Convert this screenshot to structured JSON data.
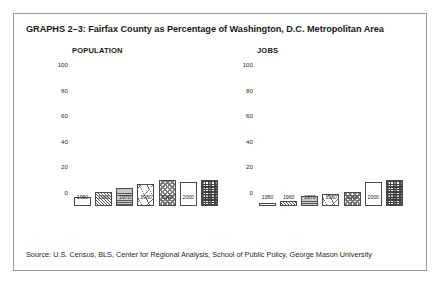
{
  "figure": {
    "title": "GRAPHS 2–3: Fairfax County as Percentage of Washington, D.C. Metropolitan Area",
    "source": "Source: U.S. Census, BLS, Center for Regional Analysis, School of Public Policy, George Mason University",
    "frame_color": "#9a9a9a",
    "text_color": "#1a1a1a"
  },
  "chart_data": [
    {
      "type": "bar",
      "title": "POPULATION",
      "categories": [
        "1950",
        "1960",
        "1970",
        "1980",
        "1990",
        "2000",
        "2007"
      ],
      "values": [
        7,
        11,
        14,
        17,
        20,
        19,
        20
      ],
      "xlabel": "",
      "ylabel": "",
      "ylim": [
        0,
        100
      ],
      "yticks": [
        0,
        20,
        40,
        60,
        80,
        100
      ],
      "grid": false,
      "legend": "none",
      "bar_patterns": [
        "dots",
        "diagonal",
        "horizontal",
        "scribble",
        "checker",
        "sparse-dots",
        "plaid"
      ]
    },
    {
      "type": "bar",
      "title": "JOBS",
      "categories": [
        "1950",
        "1960",
        "1970",
        "1980",
        "1990",
        "2000",
        "2007"
      ],
      "values": [
        2,
        4,
        8,
        9,
        11,
        19,
        20
      ],
      "xlabel": "",
      "ylabel": "",
      "ylim": [
        0,
        100
      ],
      "yticks": [
        0,
        20,
        40,
        60,
        80,
        100
      ],
      "grid": false,
      "legend": "none",
      "bar_patterns": [
        "dots",
        "diagonal",
        "horizontal",
        "scribble",
        "checker",
        "sparse-dots",
        "plaid"
      ]
    }
  ]
}
